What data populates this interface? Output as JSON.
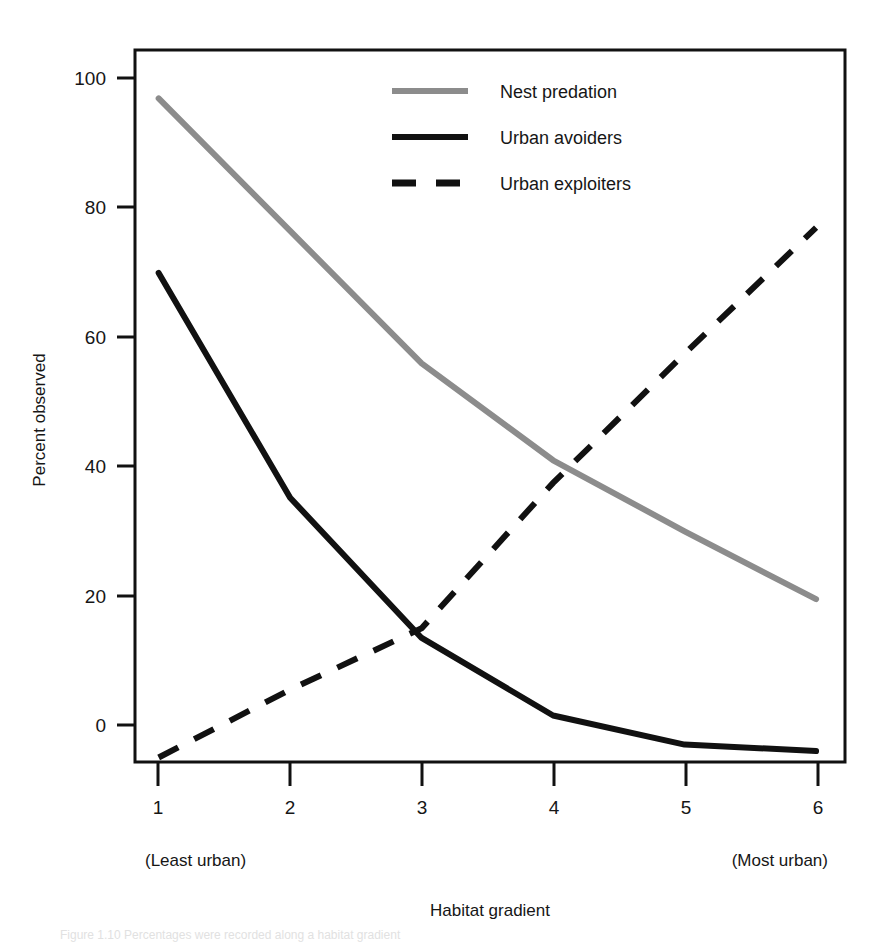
{
  "figure": {
    "background_color": "#ffffff",
    "frame_color": "#111111",
    "xaxis_title": "Habitat gradient",
    "yaxis_title": "Percent observed",
    "left_endpoint_note": "(Least urban)",
    "right_endpoint_note": "(Most urban)",
    "caption_fragment": "Figure 1.10  Percentages were recorded along a habitat gradient"
  },
  "chart_data": {
    "type": "line",
    "title": "",
    "xlabel": "Habitat gradient",
    "ylabel": "Percent observed",
    "x": [
      1,
      2,
      3,
      4,
      5,
      6
    ],
    "xtick_labels": [
      "1",
      "2",
      "3",
      "4",
      "5",
      "6"
    ],
    "ytick_labels": [
      "0",
      "20",
      "40",
      "60",
      "80",
      "100"
    ],
    "yticks": [
      0,
      20,
      40,
      60,
      80,
      100
    ],
    "xlim": [
      0.82,
      6.22
    ],
    "ylim": [
      -6.2,
      104
    ],
    "grid": false,
    "legend_position": "top-center",
    "annotations": [
      {
        "text": "(Least urban)",
        "x": 1,
        "position": "below-axis-left"
      },
      {
        "text": "(Most urban)",
        "x": 6,
        "position": "below-axis-right"
      }
    ],
    "series": [
      {
        "name": "Nest predation",
        "color": "#8c8c8c",
        "style": "solid",
        "width": 5,
        "values": [
          96.5,
          76.0,
          55.5,
          40.5,
          29.5,
          19.0
        ]
      },
      {
        "name": "Urban avoiders",
        "color": "#111111",
        "style": "solid",
        "width": 5,
        "values": [
          69.5,
          34.7,
          13.0,
          1.0,
          -3.5,
          -4.5
        ]
      },
      {
        "name": "Urban exploiters",
        "color": "#111111",
        "style": "dashed",
        "width": 5,
        "values": [
          -5.5,
          5.0,
          14.5,
          37.0,
          57.0,
          76.5
        ]
      }
    ]
  },
  "legend": {
    "items": [
      {
        "label": "Nest predation",
        "swatch": "solid-gray-line-swatch"
      },
      {
        "label": "Urban avoiders",
        "swatch": "solid-black-line-swatch"
      },
      {
        "label": "Urban exploiters",
        "swatch": "dashed-black-line-swatch"
      }
    ]
  }
}
